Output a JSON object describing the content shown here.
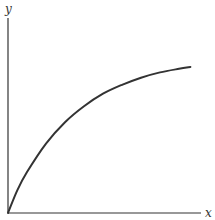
{
  "chart_data": {
    "type": "line",
    "title": "",
    "xlabel": "x",
    "ylabel": "y",
    "xlim": [
      0,
      1
    ],
    "ylim": [
      0,
      1
    ],
    "grid": false,
    "legend": "none",
    "series": [
      {
        "name": "curve",
        "description": "increasing, concave-down curve starting at the origin",
        "x": [
          0,
          0.05,
          0.1,
          0.2,
          0.3,
          0.4,
          0.5,
          0.6,
          0.7,
          0.8,
          0.9,
          0.96
        ],
        "y": [
          0,
          0.13,
          0.23,
          0.39,
          0.51,
          0.6,
          0.67,
          0.72,
          0.76,
          0.79,
          0.81,
          0.82
        ]
      }
    ]
  },
  "colors": {
    "axis": "#333333",
    "curve": "#333333",
    "background": "#ffffff"
  }
}
